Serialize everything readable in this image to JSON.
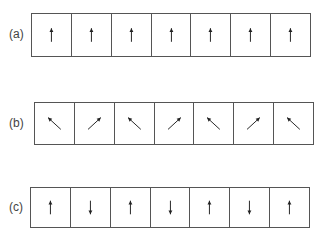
{
  "rows": [
    {
      "label": "(a)",
      "arrows": [
        "up",
        "up",
        "up",
        "up",
        "up",
        "up",
        "up"
      ]
    },
    {
      "label": "(b)",
      "arrows": [
        "up-left",
        "up-right",
        "up-left",
        "up-right",
        "up-left",
        "up-right",
        "up-left"
      ]
    },
    {
      "label": "(c)",
      "arrows": [
        "up",
        "down",
        "up",
        "down",
        "up",
        "down",
        "up"
      ]
    }
  ],
  "colors": {
    "line": "#555555",
    "arrow": "#222222",
    "label": "#444444"
  }
}
